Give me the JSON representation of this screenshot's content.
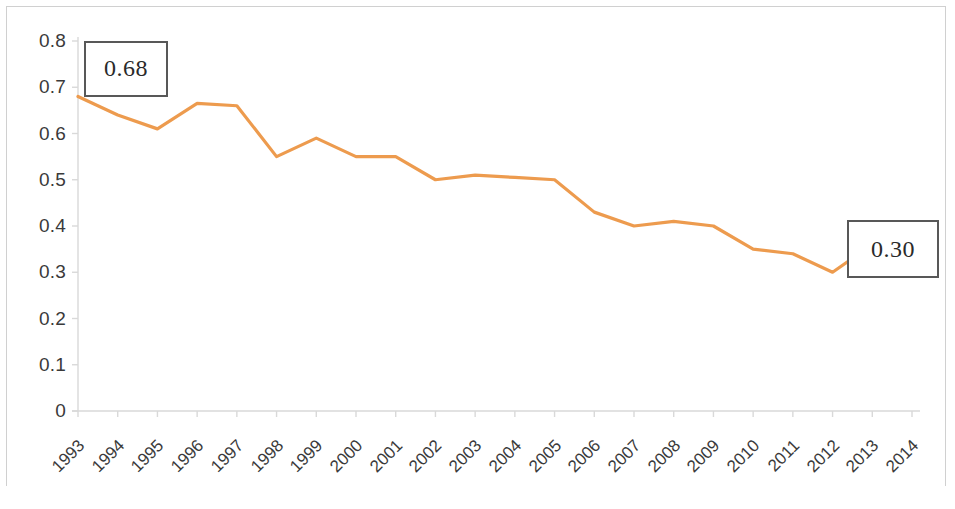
{
  "chart_data": {
    "type": "line",
    "title": "",
    "subtitle": "",
    "xlabel": "",
    "ylabel": "",
    "categories": [
      "1993",
      "1994",
      "1995",
      "1996",
      "1997",
      "1998",
      "1999",
      "2000",
      "2001",
      "2002",
      "2003",
      "2004",
      "2005",
      "2006",
      "2007",
      "2008",
      "2009",
      "2010",
      "2011",
      "2012",
      "2013",
      "2014"
    ],
    "series": [
      {
        "name": "",
        "color": "#ED9B4E",
        "values": [
          0.68,
          0.64,
          0.61,
          0.665,
          0.66,
          0.55,
          0.59,
          0.55,
          0.55,
          0.5,
          0.51,
          0.505,
          0.5,
          0.43,
          0.4,
          0.41,
          0.4,
          0.35,
          0.34,
          0.3,
          0.36,
          0.3
        ]
      }
    ],
    "ylim": [
      0,
      0.8
    ],
    "ytick_values": [
      0,
      0.1,
      0.2,
      0.3,
      0.4,
      0.5,
      0.6,
      0.7,
      0.8
    ],
    "ytick_labels": [
      "0",
      "0.1",
      "0.2",
      "0.3",
      "0.4",
      "0.5",
      "0.6",
      "0.7",
      "0.8"
    ],
    "grid": false,
    "legend": "none",
    "annotations": [
      {
        "label": "0.68",
        "category": "1993",
        "value": 0.68
      },
      {
        "label": "0.30",
        "category": "2014",
        "value": 0.3
      }
    ]
  },
  "axis": {
    "y_labels": [
      "0.8",
      "0.7",
      "0.6",
      "0.5",
      "0.4",
      "0.3",
      "0.2",
      "0.1",
      "0"
    ],
    "x_labels": [
      "1993",
      "1994",
      "1995",
      "1996",
      "1997",
      "1998",
      "1999",
      "2000",
      "2001",
      "2002",
      "2003",
      "2004",
      "2005",
      "2006",
      "2007",
      "2008",
      "2009",
      "2010",
      "2011",
      "2012",
      "2013",
      "2014"
    ]
  },
  "callouts": {
    "start": "0.68",
    "end": "0.30"
  },
  "style": {
    "line_color": "#ED9B4E",
    "axis_color": "#d9d9d9",
    "text_color": "#3a3a3a",
    "callout_border": "#585858"
  }
}
